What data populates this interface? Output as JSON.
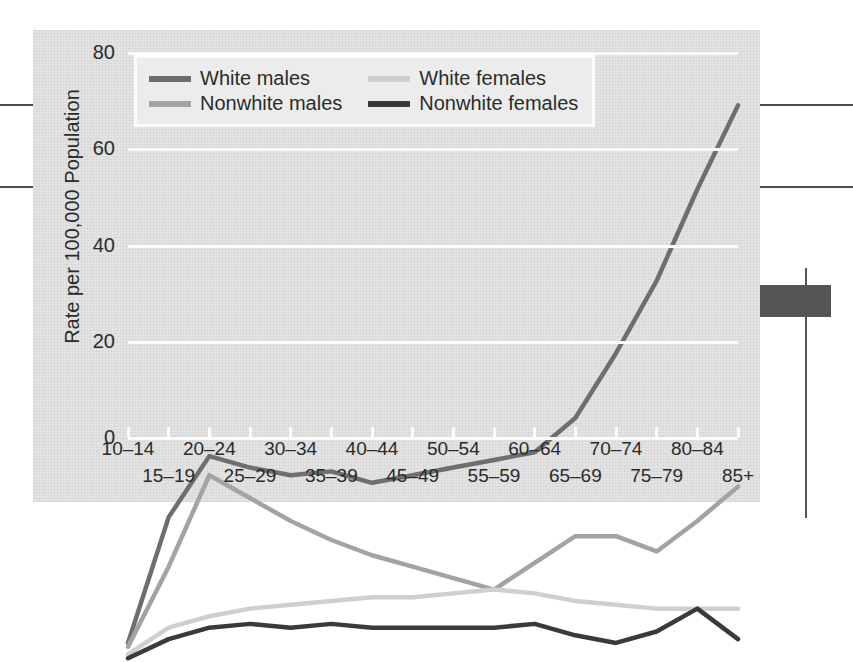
{
  "chart_data": {
    "type": "line",
    "title": "",
    "xlabel": "",
    "ylabel": "Rate per 100,000 Population",
    "ylim": [
      0,
      80
    ],
    "yticks": [
      0,
      20,
      40,
      60,
      80
    ],
    "grid": true,
    "legend_position": "top-left",
    "categories": [
      "10–14",
      "15–19",
      "20–24",
      "25–29",
      "30–34",
      "35–39",
      "40–44",
      "45–49",
      "50–54",
      "55–59",
      "60–64",
      "65–69",
      "70–74",
      "75–79",
      "80–84",
      "85+"
    ],
    "series": [
      {
        "name": "White males",
        "color": "#6e6e6e",
        "values": [
          2.5,
          19.0,
          27.0,
          25.5,
          24.5,
          25.0,
          23.5,
          24.5,
          25.5,
          26.5,
          27.5,
          32.0,
          40.5,
          50.0,
          62.0,
          73.0
        ]
      },
      {
        "name": "Nonwhite males",
        "color": "#a3a3a3",
        "values": [
          2.0,
          12.5,
          24.5,
          21.5,
          18.5,
          16.0,
          14.0,
          12.5,
          11.0,
          9.5,
          13.0,
          16.5,
          16.5,
          14.5,
          18.5,
          23.0
        ]
      },
      {
        "name": "White females",
        "color": "#cfcfcf",
        "values": [
          1.0,
          4.5,
          6.0,
          7.0,
          7.5,
          8.0,
          8.5,
          8.5,
          9.0,
          9.5,
          9.0,
          8.0,
          7.5,
          7.0,
          7.0,
          7.0
        ]
      },
      {
        "name": "Nonwhite females",
        "color": "#3a3a3a",
        "values": [
          0.5,
          3.0,
          4.5,
          5.0,
          4.5,
          5.0,
          4.5,
          4.5,
          4.5,
          4.5,
          5.0,
          3.5,
          2.5,
          4.0,
          7.0,
          3.0
        ]
      }
    ]
  },
  "legend": {
    "items": [
      {
        "label": "White males",
        "swatch": "#6e6e6e"
      },
      {
        "label": "White females",
        "swatch": "#cfcfcf"
      },
      {
        "label": "Nonwhite males",
        "swatch": "#a3a3a3"
      },
      {
        "label": "Nonwhite females",
        "swatch": "#3a3a3a"
      }
    ]
  }
}
